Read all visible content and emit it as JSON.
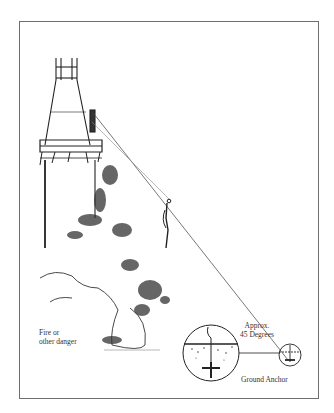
{
  "figure": {
    "labels": {
      "fire": [
        "Fire or",
        "other danger"
      ],
      "angle": [
        "Approx.",
        "45 Degrees"
      ],
      "anchor": "Ground Anchor"
    },
    "elements": [
      "tower",
      "observation-deck",
      "zip-line-cable",
      "person-on-line",
      "smoke-cloud",
      "ground-anchor-detail-circle",
      "ground-anchor-small-circle"
    ],
    "colors": {
      "ink": "#222222",
      "frame": "#6f6f6f",
      "background": "#ffffff"
    }
  }
}
